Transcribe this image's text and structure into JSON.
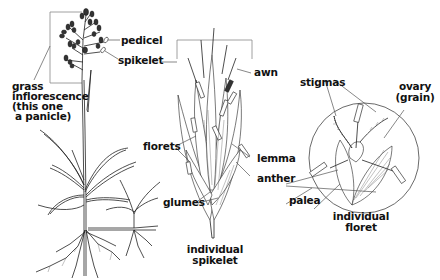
{
  "diagram": {
    "panels": [
      {
        "id": "whole-plant",
        "labels": {
          "pedicel": "pedicel",
          "spikelet": "spikelet",
          "inflorescence_line1": "grass",
          "inflorescence_line2": "inflorescence",
          "inflorescence_line3": "(this one",
          "inflorescence_line4": "a panicle)"
        }
      },
      {
        "id": "spikelet",
        "labels": {
          "awn": "awn",
          "florets": "florets",
          "lemma": "lemma",
          "anther": "anther",
          "glumes": "glumes",
          "caption_line1": "individual",
          "caption_line2": "spikelet"
        }
      },
      {
        "id": "floret",
        "labels": {
          "stigmas": "stigmas",
          "ovary_line1": "ovary",
          "ovary_line2": "(grain)",
          "palea": "palea",
          "caption_line1": "individual",
          "caption_line2": "floret"
        }
      }
    ],
    "colors": {
      "ink": "#222222",
      "leader_line": "#555555",
      "bracket": "#888888",
      "background": "#ffffff"
    }
  }
}
